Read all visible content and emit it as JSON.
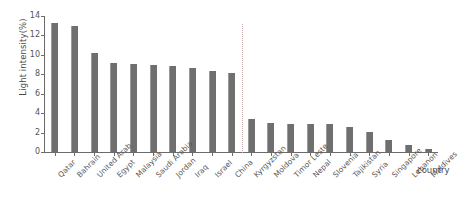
{
  "chart_data": {
    "type": "bar",
    "title": "",
    "xlabel": "country",
    "ylabel": "Light intensity(%)",
    "ylim": [
      0,
      14
    ],
    "yticks": [
      0,
      2,
      4,
      6,
      8,
      10,
      12,
      14
    ],
    "grid": false,
    "legend": null,
    "categories": [
      "Qatar",
      "Bahrain",
      "United Arab",
      "Egypt",
      "Malaysia",
      "Saudi Arabia",
      "Jordan",
      "Iraq",
      "Israel",
      "China",
      "Kyrgyzstan",
      "Moldova",
      "Timor Leste",
      "Nepal",
      "Slovenia",
      "Tajikistan",
      "Syria",
      "Singapore",
      "Lebanon",
      "Maldives"
    ],
    "values": [
      13.3,
      13.0,
      10.2,
      9.2,
      9.1,
      9.0,
      8.9,
      8.6,
      8.3,
      8.1,
      3.4,
      3.0,
      2.9,
      2.9,
      2.9,
      2.6,
      2.1,
      1.2,
      0.7,
      0.3
    ],
    "annotations": [
      {
        "name": "group-divider",
        "type": "vertical-dotted-line",
        "after_category": "China"
      }
    ],
    "colors": {
      "bar": "#6f6f6f",
      "bar_edge": "#9a9a9a",
      "axis": "#6b6b6b",
      "text": "#555555",
      "divider": "#c9a9a9",
      "background": "#ffffff"
    }
  }
}
